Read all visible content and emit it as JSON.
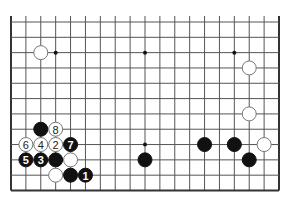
{
  "diagram": {
    "type": "go-board-partial",
    "board_size": 19,
    "visible_columns": [
      1,
      19
    ],
    "visible_rows": [
      8,
      19
    ],
    "edges": {
      "left": true,
      "right": true,
      "bottom": true,
      "top": false
    },
    "hoshi": [
      {
        "col": 4,
        "row": 10
      },
      {
        "col": 10,
        "row": 10
      },
      {
        "col": 16,
        "row": 10
      },
      {
        "col": 4,
        "row": 16
      },
      {
        "col": 10,
        "row": 16
      },
      {
        "col": 16,
        "row": 16
      }
    ],
    "stones": [
      {
        "color": "white",
        "col": 3,
        "row": 10,
        "label": ""
      },
      {
        "color": "white",
        "col": 17,
        "row": 11,
        "label": ""
      },
      {
        "color": "white",
        "col": 17,
        "row": 14,
        "label": ""
      },
      {
        "color": "black",
        "col": 3,
        "row": 15,
        "label": ""
      },
      {
        "color": "white",
        "col": 4,
        "row": 15,
        "label": "8"
      },
      {
        "color": "white",
        "col": 2,
        "row": 16,
        "label": "6"
      },
      {
        "color": "white",
        "col": 3,
        "row": 16,
        "label": "4"
      },
      {
        "color": "white",
        "col": 4,
        "row": 16,
        "label": "2"
      },
      {
        "color": "black",
        "col": 5,
        "row": 16,
        "label": "7"
      },
      {
        "color": "black",
        "col": 14,
        "row": 16,
        "label": ""
      },
      {
        "color": "black",
        "col": 16,
        "row": 16,
        "label": ""
      },
      {
        "color": "white",
        "col": 18,
        "row": 16,
        "label": ""
      },
      {
        "color": "black",
        "col": 2,
        "row": 17,
        "label": "5"
      },
      {
        "color": "black",
        "col": 3,
        "row": 17,
        "label": "3"
      },
      {
        "color": "black",
        "col": 4,
        "row": 17,
        "label": ""
      },
      {
        "color": "white",
        "col": 5,
        "row": 17,
        "label": ""
      },
      {
        "color": "black",
        "col": 10,
        "row": 17,
        "label": ""
      },
      {
        "color": "black",
        "col": 17,
        "row": 17,
        "label": ""
      },
      {
        "color": "white",
        "col": 4,
        "row": 18,
        "label": ""
      },
      {
        "color": "black",
        "col": 5,
        "row": 18,
        "label": ""
      },
      {
        "color": "black",
        "col": 6,
        "row": 18,
        "label": "1"
      }
    ]
  }
}
